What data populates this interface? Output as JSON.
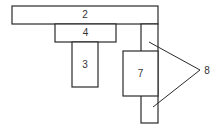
{
  "diagram": {
    "type": "mechanical-assembly-sketch",
    "parts": [
      {
        "id": "2",
        "label": "2",
        "x": 12,
        "y": 6,
        "w": 146,
        "h": 18
      },
      {
        "id": "4",
        "label": "4",
        "x": 55,
        "y": 24,
        "w": 61,
        "h": 18
      },
      {
        "id": "3",
        "label": "3",
        "x": 72,
        "y": 42,
        "w": 26,
        "h": 45
      },
      {
        "id": "8",
        "label": "",
        "x": 141,
        "y": 24,
        "w": 17,
        "h": 99
      },
      {
        "id": "7",
        "label": "7",
        "x": 123,
        "y": 51,
        "w": 35,
        "h": 45
      }
    ],
    "callouts": [
      {
        "label": "8",
        "text_x": 207,
        "text_y": 71,
        "apex": [
          200,
          70
        ],
        "targets": [
          [
            149,
            42
          ],
          [
            153,
            107
          ]
        ]
      }
    ],
    "stroke_color": "#2a2a2a",
    "fill_color": "#ffffff"
  }
}
